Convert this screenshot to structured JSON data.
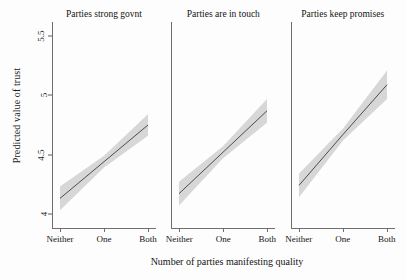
{
  "chart_data": {
    "type": "line",
    "title": "",
    "xlabel": "Number of parties manifesting quality",
    "ylabel": "Predicted value of trust",
    "categories": [
      "Neither",
      "One",
      "Both"
    ],
    "x": [
      0,
      1,
      2
    ],
    "ylim": [
      3.88,
      5.62
    ],
    "yticks": [
      4,
      4.5,
      5,
      5.5
    ],
    "ytick_labels": [
      "4",
      "4.5",
      "5",
      "5.5"
    ],
    "grid": false,
    "legend": "none",
    "band_label": "95% confidence interval",
    "panels": [
      {
        "title": "Parties strong govnt",
        "series": [
          {
            "name": "Predicted value of trust",
            "values": [
              4.13,
              4.44,
              4.75
            ],
            "ci_lower": [
              4.03,
              4.39,
              4.66
            ],
            "ci_upper": [
              4.23,
              4.49,
              4.84
            ]
          }
        ]
      },
      {
        "title": "Parties are in touch",
        "series": [
          {
            "name": "Predicted value of trust",
            "values": [
              4.17,
              4.52,
              4.87
            ],
            "ci_lower": [
              4.07,
              4.47,
              4.77
            ],
            "ci_upper": [
              4.27,
              4.57,
              4.97
            ]
          }
        ]
      },
      {
        "title": "Parties keep promises",
        "series": [
          {
            "name": "Predicted value of trust",
            "values": [
              4.24,
              4.67,
              5.09
            ],
            "ci_lower": [
              4.14,
              4.62,
              4.97
            ],
            "ci_upper": [
              4.34,
              4.72,
              5.21
            ]
          }
        ]
      }
    ],
    "colors": {
      "line": "#3c3c3c",
      "band": "#d7d7d7",
      "axis": "#6e6e6e",
      "text": "#141414",
      "background": "#fdfdfd"
    }
  }
}
